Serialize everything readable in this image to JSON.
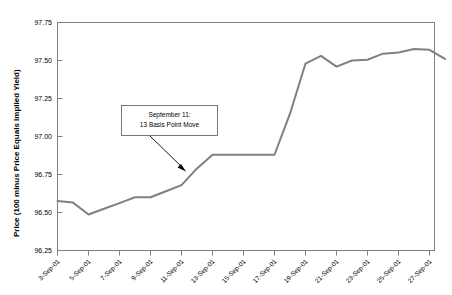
{
  "chart_data": {
    "type": "line",
    "title": "",
    "xlabel": "",
    "ylabel": "Price (100 minus Price Equals Implied Yield)",
    "ylim": [
      96.25,
      97.75
    ],
    "ytick_labels": [
      "97.75",
      "97.50",
      "97.25",
      "97.00",
      "96.75",
      "96.50",
      "96.25"
    ],
    "ytick_values": [
      97.75,
      97.5,
      97.25,
      97.0,
      96.75,
      96.5,
      96.25
    ],
    "grid": false,
    "legend": "none",
    "categories": [
      "3-Sep-01",
      "4-Sep-01",
      "5-Sep-01",
      "6-Sep-01",
      "7-Sep-01",
      "8-Sep-01",
      "9-Sep-01",
      "10-Sep-01",
      "11-Sep-01",
      "12-Sep-01",
      "13-Sep-01",
      "14-Sep-01",
      "15-Sep-01",
      "16-Sep-01",
      "17-Sep-01",
      "18-Sep-01",
      "19-Sep-01",
      "20-Sep-01",
      "21-Sep-01",
      "22-Sep-01",
      "23-Sep-01",
      "24-Sep-01",
      "25-Sep-01",
      "26-Sep-01",
      "27-Sep-01",
      "28-Sep-01"
    ],
    "xtick_labels": [
      "3-Sep-01",
      "5-Sep-01",
      "7-Sep-01",
      "9-Sep-01",
      "11-Sep-01",
      "13-Sep-01",
      "15-Sep-01",
      "17-Sep-01",
      "19-Sep-01",
      "21-Sep-01",
      "23-Sep-01",
      "25-Sep-01",
      "27-Sep-01"
    ],
    "values": [
      96.575,
      96.565,
      96.487,
      96.525,
      96.562,
      96.6,
      96.6,
      96.64,
      96.68,
      96.79,
      96.88,
      96.88,
      96.88,
      96.88,
      96.88,
      97.15,
      97.48,
      97.53,
      97.46,
      97.5,
      97.505,
      97.545,
      97.552,
      97.575,
      97.57,
      97.51
    ],
    "annotation": {
      "line1": "September 11:",
      "line2": "13 Basis Point Move"
    },
    "colors": {
      "line": "#808080",
      "frame": "#808080",
      "text": "#000000",
      "background": "#ffffff"
    }
  }
}
